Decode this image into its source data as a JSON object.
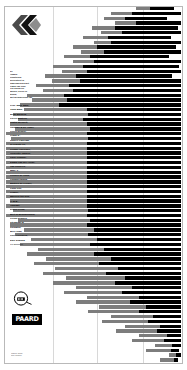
{
  "poster": {
    "background_color": "#ffffff",
    "bar_gray": "#7d7d7d",
    "bar_black": "#000000",
    "grid_color": "#d8d8d8"
  },
  "logo": {
    "mark_name": "double-chevron-logo",
    "circle_logo_name": "circular-emblem-logo",
    "wordmark": "PAARD"
  },
  "intro": {
    "lines": [
      "De",
      "Haagse",
      "Kunstkring",
      "presenteert in",
      "samenwerking met",
      "Paard van Troje",
      "een avond vol",
      "muziek, beeld en",
      "woord,",
      "met medewerking van"
    ]
  },
  "credits": {
    "names": [
      "Prof. Mark Bain,",
      "John Bain,",
      "Bilan Bargeld,",
      "Pierre Bastien,",
      "Justin Bennett,",
      "Chiavari & De Vogel,",
      "Gerrit Dekker,",
      "Frank S.,",
      "Robert Gwilliam,",
      "of Tribute To,",
      "Gregor Hoefliger,",
      "Henriette Jansen,",
      "Kalle Kemppi,",
      "Edwin van der Heide,",
      "Jan Robbers,",
      "Mme J.,",
      "Gerben de Jong,",
      "Knappertband,",
      "Bastien de Krijger,",
      "Lotty Kitt,",
      "Lemell,",
      "Marcien ten Nijs,",
      "O.M.B.,",
      "Opblast,",
      "Djurre Prins,",
      "Bert of Brandenburg,",
      "Freon Slippen,",
      "Steadfast &",
      "Soldaten,",
      "Ben Lodd,",
      "Kurt Overberg,",
      "Elke Simons",
      "en anderen."
    ]
  },
  "colophon": {
    "lines": [
      "ontwerp: studio",
      "druk: drukkerij"
    ]
  },
  "chart_data": {
    "type": "bar",
    "title": "",
    "xlabel": "",
    "ylabel": "",
    "grid": true,
    "grid_x": [
      0.27,
      0.52,
      0.78
    ],
    "note": "Each row is a horizontal two-tone bar. start/mid/end are fractions of the field width (0..1). Gray runs start->mid, black runs mid->end.",
    "rows": [
      {
        "start": 0.74,
        "mid": 0.82,
        "end": 0.96
      },
      {
        "start": 0.6,
        "mid": 0.72,
        "end": 1.0
      },
      {
        "start": 0.56,
        "mid": 0.68,
        "end": 0.92
      },
      {
        "start": 0.62,
        "mid": 0.74,
        "end": 1.0
      },
      {
        "start": 0.49,
        "mid": 0.62,
        "end": 0.98
      },
      {
        "start": 0.54,
        "mid": 0.66,
        "end": 1.0
      },
      {
        "start": 0.44,
        "mid": 0.58,
        "end": 0.94
      },
      {
        "start": 0.5,
        "mid": 0.6,
        "end": 1.0
      },
      {
        "start": 0.38,
        "mid": 0.52,
        "end": 0.97
      },
      {
        "start": 0.43,
        "mid": 0.56,
        "end": 1.0
      },
      {
        "start": 0.33,
        "mid": 0.48,
        "end": 0.93
      },
      {
        "start": 0.38,
        "mid": 0.5,
        "end": 1.0
      },
      {
        "start": 0.27,
        "mid": 0.44,
        "end": 0.99
      },
      {
        "start": 0.32,
        "mid": 0.46,
        "end": 1.0
      },
      {
        "start": 0.22,
        "mid": 0.4,
        "end": 0.95
      },
      {
        "start": 0.26,
        "mid": 0.42,
        "end": 1.0
      },
      {
        "start": 0.17,
        "mid": 0.36,
        "end": 1.0
      },
      {
        "start": 0.21,
        "mid": 0.38,
        "end": 1.0
      },
      {
        "start": 0.12,
        "mid": 0.33,
        "end": 1.0
      },
      {
        "start": 0.15,
        "mid": 0.35,
        "end": 1.0
      },
      {
        "start": 0.08,
        "mid": 0.3,
        "end": 1.0
      },
      {
        "start": 0.1,
        "mid": 0.46,
        "end": 1.0
      },
      {
        "start": 0.04,
        "mid": 0.47,
        "end": 1.0
      },
      {
        "start": 0.07,
        "mid": 0.44,
        "end": 1.0
      },
      {
        "start": 0.02,
        "mid": 0.46,
        "end": 1.0
      },
      {
        "start": 0.05,
        "mid": 0.48,
        "end": 1.0
      },
      {
        "start": 0.0,
        "mid": 0.46,
        "end": 1.0
      },
      {
        "start": 0.03,
        "mid": 0.47,
        "end": 1.0
      },
      {
        "start": 0.0,
        "mid": 0.46,
        "end": 1.0
      },
      {
        "start": 0.0,
        "mid": 0.46,
        "end": 1.0
      },
      {
        "start": 0.0,
        "mid": 0.46,
        "end": 1.0
      },
      {
        "start": 0.0,
        "mid": 0.46,
        "end": 1.0
      },
      {
        "start": 0.0,
        "mid": 0.46,
        "end": 1.0
      },
      {
        "start": 0.0,
        "mid": 0.46,
        "end": 1.0
      },
      {
        "start": 0.0,
        "mid": 0.46,
        "end": 1.0
      },
      {
        "start": 0.0,
        "mid": 0.46,
        "end": 1.0
      },
      {
        "start": 0.0,
        "mid": 0.46,
        "end": 1.0
      },
      {
        "start": 0.0,
        "mid": 0.46,
        "end": 1.0
      },
      {
        "start": 0.0,
        "mid": 0.46,
        "end": 1.0
      },
      {
        "start": 0.0,
        "mid": 0.46,
        "end": 1.0
      },
      {
        "start": 0.02,
        "mid": 0.46,
        "end": 1.0
      },
      {
        "start": 0.0,
        "mid": 0.46,
        "end": 1.0
      },
      {
        "start": 0.04,
        "mid": 0.47,
        "end": 1.0
      },
      {
        "start": 0.0,
        "mid": 0.46,
        "end": 1.0
      },
      {
        "start": 0.07,
        "mid": 0.48,
        "end": 1.0
      },
      {
        "start": 0.02,
        "mid": 0.46,
        "end": 1.0
      },
      {
        "start": 0.1,
        "mid": 0.5,
        "end": 1.0
      },
      {
        "start": 0.05,
        "mid": 0.47,
        "end": 1.0
      },
      {
        "start": 0.14,
        "mid": 0.52,
        "end": 1.0
      },
      {
        "start": 0.08,
        "mid": 0.48,
        "end": 1.0
      },
      {
        "start": 0.18,
        "mid": 0.56,
        "end": 1.0
      },
      {
        "start": 0.12,
        "mid": 0.5,
        "end": 1.0
      },
      {
        "start": 0.23,
        "mid": 0.6,
        "end": 1.0
      },
      {
        "start": 0.16,
        "mid": 0.53,
        "end": 1.0
      },
      {
        "start": 0.28,
        "mid": 0.64,
        "end": 1.0
      },
      {
        "start": 0.21,
        "mid": 0.57,
        "end": 1.0
      },
      {
        "start": 0.34,
        "mid": 0.68,
        "end": 1.0
      },
      {
        "start": 0.27,
        "mid": 0.62,
        "end": 1.0
      },
      {
        "start": 0.4,
        "mid": 0.72,
        "end": 1.0
      },
      {
        "start": 0.33,
        "mid": 0.66,
        "end": 1.0
      },
      {
        "start": 0.46,
        "mid": 0.76,
        "end": 1.0
      },
      {
        "start": 0.4,
        "mid": 0.71,
        "end": 1.0
      },
      {
        "start": 0.53,
        "mid": 0.8,
        "end": 1.0
      },
      {
        "start": 0.47,
        "mid": 0.76,
        "end": 1.0
      },
      {
        "start": 0.6,
        "mid": 0.84,
        "end": 1.0
      },
      {
        "start": 0.55,
        "mid": 0.81,
        "end": 1.0
      },
      {
        "start": 0.68,
        "mid": 0.88,
        "end": 1.0
      },
      {
        "start": 0.63,
        "mid": 0.86,
        "end": 1.0
      },
      {
        "start": 0.76,
        "mid": 0.92,
        "end": 1.0
      },
      {
        "start": 0.72,
        "mid": 0.9,
        "end": 1.0
      },
      {
        "start": 0.85,
        "mid": 0.95,
        "end": 1.0
      },
      {
        "start": 0.8,
        "mid": 0.94,
        "end": 0.99
      },
      {
        "start": 0.93,
        "mid": 0.97,
        "end": 1.0
      },
      {
        "start": 0.88,
        "mid": 0.96,
        "end": 0.98
      }
    ]
  }
}
